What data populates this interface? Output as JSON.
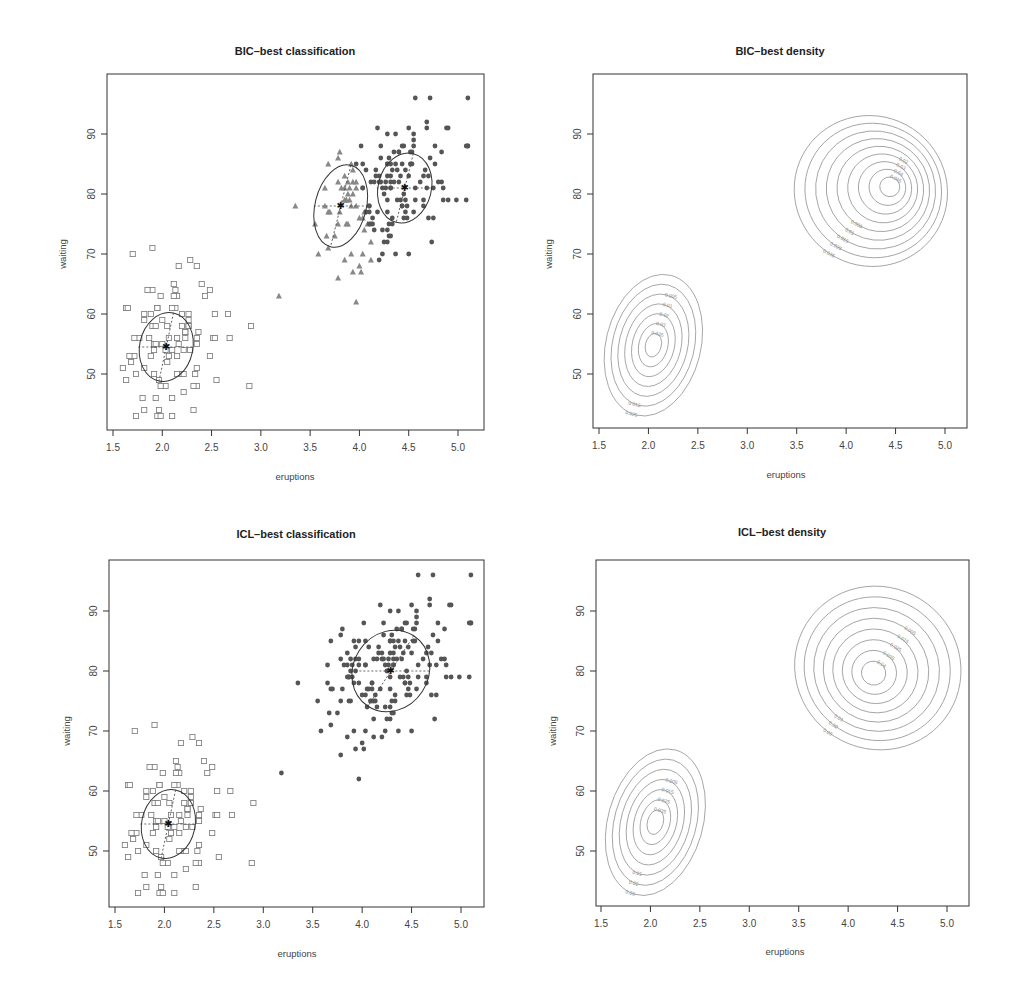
{
  "chart_data": [
    {
      "id": "bic-class",
      "type": "scatter",
      "title": "BIC–best classification",
      "xlabel": "eruptions",
      "ylabel": "waiting",
      "xticks": [
        "1.5",
        "2.0",
        "2.5",
        "3.0",
        "3.5",
        "4.0",
        "4.5",
        "5.0"
      ],
      "yticks": [
        "50",
        "60",
        "70",
        "80",
        "90"
      ],
      "xlim": [
        1.45,
        5.25
      ],
      "ylim": [
        41,
        97
      ],
      "box": {
        "x0": 107,
        "y0": 74,
        "x1": 484,
        "y1": 430
      },
      "tickpx": {
        "x15": 113,
        "x50": 458,
        "y50": 374,
        "y90": 134
      },
      "clusters": 3,
      "components": [
        {
          "label": "cluster-1",
          "marker": "square",
          "mean": [
            2.04,
            54.5
          ],
          "ellipse": {
            "rx": 0.27,
            "ry": 5.8,
            "angle_deg": 12
          }
        },
        {
          "label": "cluster-2",
          "marker": "triangle",
          "mean": [
            3.81,
            78.0
          ],
          "ellipse": {
            "rx": 0.26,
            "ry": 7.0,
            "angle_deg": 14
          }
        },
        {
          "label": "cluster-3",
          "marker": "circle",
          "mean": [
            4.46,
            81.0
          ],
          "ellipse": {
            "rx": 0.27,
            "ry": 5.9,
            "angle_deg": 14
          }
        }
      ]
    },
    {
      "id": "bic-dens",
      "type": "contour",
      "title": "BIC–best density",
      "xlabel": "eruptions",
      "ylabel": "waiting",
      "xticks": [
        "1.5",
        "2.0",
        "2.5",
        "3.0",
        "3.5",
        "4.0",
        "4.5",
        "5.0"
      ],
      "yticks": [
        "50",
        "60",
        "70",
        "80",
        "90"
      ],
      "box": {
        "x0": 593,
        "y0": 74,
        "x1": 967,
        "y1": 428
      },
      "tickpx": {
        "x15": 599,
        "x50": 945,
        "y50": 374,
        "y90": 134
      },
      "contour_levels_upper": [
        "0.005",
        "0.01",
        "0.015",
        "0.02",
        "0.025",
        "0.03",
        "0.035",
        "0.04",
        "0.045"
      ],
      "contour_levels_lower": [
        "0.005",
        "0.01",
        "0.015",
        "0.02",
        "0.025",
        "0.03",
        "0.035"
      ],
      "label_upper_top": [
        "0.02",
        "0.03",
        "0.04",
        "0.045"
      ],
      "label_upper_bottom": [
        "0.035",
        "0.025",
        "0.015",
        "0.01",
        "0.005"
      ],
      "label_lower_top": [
        "0.005",
        "0.01",
        "0.02",
        "0.03",
        "0.035"
      ],
      "label_lower_bottom": [
        "0.025",
        "0.015"
      ]
    },
    {
      "id": "icl-class",
      "type": "scatter",
      "title": "ICL–best classification",
      "xlabel": "eruptions",
      "ylabel": "waiting",
      "xticks": [
        "1.5",
        "2.0",
        "2.5",
        "3.0",
        "3.5",
        "4.0",
        "4.5",
        "5.0"
      ],
      "yticks": [
        "50",
        "60",
        "70",
        "80",
        "90"
      ],
      "box": {
        "x0": 109,
        "y0": 560,
        "x1": 484,
        "y1": 907
      },
      "tickpx": {
        "x15": 115,
        "x50": 461,
        "y50": 851,
        "y90": 611
      },
      "clusters": 2,
      "components": [
        {
          "label": "cluster-1",
          "marker": "square",
          "mean": [
            2.04,
            54.5
          ],
          "ellipse": {
            "rx": 0.27,
            "ry": 5.8,
            "angle_deg": 12
          }
        },
        {
          "label": "cluster-2",
          "marker": "circle",
          "mean": [
            4.29,
            80.0
          ],
          "ellipse": {
            "rx": 0.38,
            "ry": 7.0,
            "angle_deg": 33
          }
        }
      ]
    },
    {
      "id": "icl-dens",
      "type": "contour",
      "title": "ICL–best density",
      "xlabel": "eruptions",
      "ylabel": "waiting",
      "xticks": [
        "1.5",
        "2.0",
        "2.5",
        "3.0",
        "3.5",
        "4.0",
        "4.5",
        "5.0"
      ],
      "yticks": [
        "50",
        "60",
        "70",
        "80",
        "90"
      ],
      "box": {
        "x0": 596,
        "y0": 560,
        "x1": 969,
        "y1": 906
      },
      "tickpx": {
        "x15": 601,
        "x50": 947,
        "y50": 851,
        "y90": 611
      },
      "contour_levels_upper": [
        "0.005",
        "0.01",
        "0.015",
        "0.02",
        "0.025",
        "0.03",
        "0.035",
        "0.04"
      ],
      "contour_levels_lower": [
        "0.005",
        "0.01",
        "0.015",
        "0.02",
        "0.025",
        "0.03",
        "0.035"
      ],
      "label_upper_top": [
        "0.005",
        "0.015",
        "0.025",
        "0.035",
        "0.04"
      ],
      "label_upper_bottom": [
        "0.03",
        "0.02",
        "0.01"
      ],
      "label_lower_top": [
        "0.005",
        "0.015",
        "0.025",
        "0.035"
      ],
      "label_lower_bottom": [
        "0.03",
        "0.02",
        "0.01"
      ]
    }
  ]
}
